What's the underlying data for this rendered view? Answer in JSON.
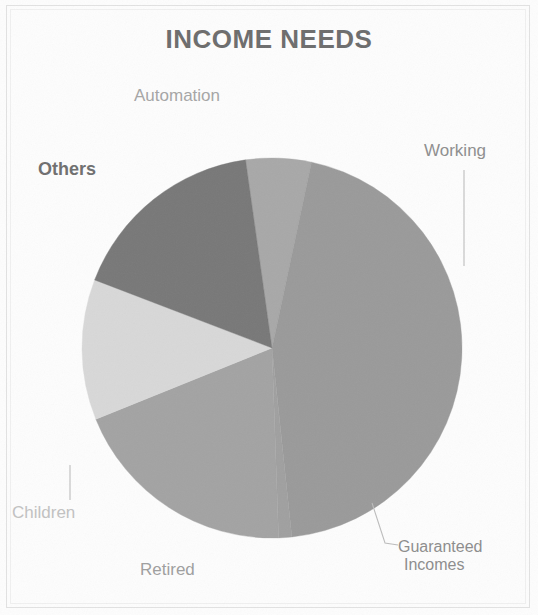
{
  "chart_data": {
    "type": "pie",
    "title": "INCOME NEEDS",
    "xlabel": "",
    "ylabel": "",
    "legend_position": "none",
    "labels_position": "outside",
    "grid": false,
    "categories": [
      "Automation",
      "Working",
      "Guaranteed Incomes",
      "Retired",
      "Children",
      "Others"
    ],
    "values": [
      4,
      45,
      1,
      20,
      12,
      18
    ],
    "slices": [
      {
        "label": "Automation",
        "value": 4,
        "percent": 4,
        "start_angle_deg": 352,
        "end_angle_deg": 12,
        "color": "#a8a8a8",
        "label_color": "#a6a6a6",
        "label_bold": false
      },
      {
        "label": "Working",
        "value": 45,
        "percent": 45,
        "start_angle_deg": 12,
        "end_angle_deg": 174,
        "color": "#9a9a9a",
        "label_color": "#8f8f8f",
        "label_bold": false
      },
      {
        "label": "Guaranteed Incomes",
        "value": 1,
        "percent": 1,
        "start_angle_deg": 174,
        "end_angle_deg": 178,
        "color": "#a0a0a0",
        "label_color": "#8d8d8d",
        "label_bold": false
      },
      {
        "label": "Retired",
        "value": 20,
        "percent": 20,
        "start_angle_deg": 178,
        "end_angle_deg": 248,
        "color": "#a3a3a3",
        "label_color": "#9f9f9f",
        "label_bold": false
      },
      {
        "label": "Children",
        "value": 12,
        "percent": 12,
        "start_angle_deg": 248,
        "end_angle_deg": 291,
        "color": "#d8d8d8",
        "label_color": "#c2c2c2",
        "label_bold": false
      },
      {
        "label": "Others",
        "value": 18,
        "percent": 18,
        "start_angle_deg": 291,
        "end_angle_deg": 352,
        "color": "#787878",
        "label_color": "#6f6f6f",
        "label_bold": true
      }
    ],
    "geometry": {
      "center_x": 272,
      "center_y": 348,
      "radius": 190
    },
    "leader_lines": [
      {
        "for": "Working",
        "points": "464,170 464,266"
      },
      {
        "for": "Children",
        "points": "70,465 70,500"
      },
      {
        "for": "Guaranteed Incomes",
        "points": "372,503 385,543 398,545"
      }
    ]
  },
  "labels": {
    "automation": "Automation",
    "others": "Others",
    "working": "Working",
    "children": "Children",
    "retired": "Retired",
    "guaranteed_line1": "Guaranteed",
    "guaranteed_line2": "Incomes"
  },
  "title": {
    "text": "INCOME NEEDS",
    "color": "#6d6d6d"
  },
  "colors": {
    "background": "#fdfdfd",
    "frame": "#e2e2e2",
    "leader_line": "#bdbdbd"
  }
}
